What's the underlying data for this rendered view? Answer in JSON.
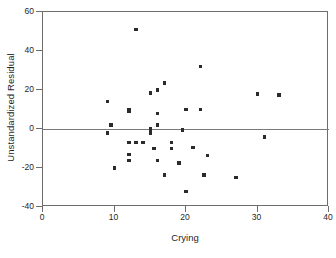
{
  "chart_data": {
    "type": "scatter",
    "title": "",
    "xlabel": "Crying",
    "ylabel": "Unstandardized Residual",
    "xlim": [
      0,
      40
    ],
    "ylim": [
      -40,
      60
    ],
    "xticks": [
      0,
      10,
      20,
      30,
      40
    ],
    "yticks": [
      -40,
      -20,
      0,
      20,
      40,
      60
    ],
    "xtick_labels": [
      "0",
      "10",
      "20",
      "30",
      "40"
    ],
    "ytick_labels": [
      "-40",
      "-20",
      "0",
      "20",
      "40",
      "60"
    ],
    "grid": false,
    "legend": null,
    "reference_lines": [
      {
        "name": "zero-residual-line",
        "axis": "y",
        "value": 0
      }
    ],
    "marker": {
      "shape": "square",
      "color": "#2b2b2b",
      "size_px": 3.4
    },
    "points": [
      {
        "x": 9.0,
        "y": 14.0
      },
      {
        "x": 9.0,
        "y": -2.0
      },
      {
        "x": 9.5,
        "y": 2.0
      },
      {
        "x": 10.0,
        "y": -20.0
      },
      {
        "x": 12.0,
        "y": 10.0
      },
      {
        "x": 12.0,
        "y": 9.0
      },
      {
        "x": 12.0,
        "y": -7.0
      },
      {
        "x": 12.0,
        "y": -13.0
      },
      {
        "x": 12.0,
        "y": -16.0
      },
      {
        "x": 13.0,
        "y": 51.0
      },
      {
        "x": 13.0,
        "y": -7.0
      },
      {
        "x": 14.0,
        "y": -7.0
      },
      {
        "x": 15.0,
        "y": 18.5
      },
      {
        "x": 15.0,
        "y": 0.0
      },
      {
        "x": 15.0,
        "y": -2.0
      },
      {
        "x": 15.5,
        "y": -10.0
      },
      {
        "x": 16.0,
        "y": 20.0
      },
      {
        "x": 16.0,
        "y": 8.0
      },
      {
        "x": 16.0,
        "y": 2.0
      },
      {
        "x": 16.0,
        "y": -16.0
      },
      {
        "x": 17.0,
        "y": 23.5
      },
      {
        "x": 17.0,
        "y": -23.5
      },
      {
        "x": 18.0,
        "y": -7.0
      },
      {
        "x": 18.0,
        "y": -10.0
      },
      {
        "x": 19.0,
        "y": -17.5
      },
      {
        "x": 19.5,
        "y": -0.5
      },
      {
        "x": 20.0,
        "y": 10.0
      },
      {
        "x": 20.0,
        "y": -32.0
      },
      {
        "x": 21.0,
        "y": -9.5
      },
      {
        "x": 22.0,
        "y": 32.0
      },
      {
        "x": 22.0,
        "y": 10.0
      },
      {
        "x": 22.5,
        "y": -23.5
      },
      {
        "x": 23.0,
        "y": -13.5
      },
      {
        "x": 27.0,
        "y": -25.0
      },
      {
        "x": 30.0,
        "y": 18.0
      },
      {
        "x": 31.0,
        "y": -4.0
      },
      {
        "x": 33.0,
        "y": 17.5
      }
    ]
  }
}
